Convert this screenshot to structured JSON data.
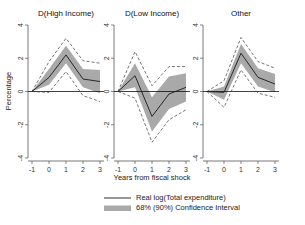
{
  "figure": {
    "xlabel": "Years from fiscal shock",
    "ylabel": "Percentage"
  },
  "legend": {
    "line_label": "Real log(Total expenditure)",
    "band_label": "68% (90%) Confidence Interval",
    "line_color": "#1a1a1a",
    "band_color": "#a9a9a9"
  },
  "chart_data": {
    "type": "line",
    "title": "",
    "xlabel": "Years from fiscal shock",
    "ylabel": "Percentage",
    "x": [
      -1,
      0,
      1,
      2,
      3
    ],
    "xticks": [
      "-1",
      "0",
      "1",
      "2",
      "3"
    ],
    "yticks": [
      "-4",
      "-2",
      "0",
      "2",
      "4"
    ],
    "ylim": [
      -4,
      4
    ],
    "xlim": [
      -1,
      3
    ],
    "grid": false,
    "legend_position": "bottom",
    "panels": [
      {
        "title": "D(High Income)",
        "series": [
          {
            "name": "Real log(Total expenditure)",
            "values": [
              0,
              0.85,
              2.2,
              0.75,
              0.6
            ]
          },
          {
            "name": "68% CI upper",
            "values": [
              0,
              1.35,
              2.75,
              1.35,
              1.3
            ]
          },
          {
            "name": "68% CI lower",
            "values": [
              0,
              0.4,
              1.7,
              0.25,
              -0.1
            ]
          },
          {
            "name": "90% CI upper",
            "values": [
              0,
              1.8,
              3.2,
              1.85,
              1.7
            ]
          },
          {
            "name": "90% CI lower",
            "values": [
              0,
              -0.05,
              1.2,
              -0.25,
              -0.6
            ]
          }
        ]
      },
      {
        "title": "D(Low Income)",
        "series": [
          {
            "name": "Real log(Total expenditure)",
            "values": [
              0,
              0.95,
              -1.5,
              -0.15,
              0.25
            ]
          },
          {
            "name": "68% CI upper",
            "values": [
              0,
              1.7,
              -0.35,
              0.9,
              1.1
            ]
          },
          {
            "name": "68% CI lower",
            "values": [
              0,
              0.25,
              -2.4,
              -1.05,
              -0.6
            ]
          },
          {
            "name": "90% CI upper",
            "values": [
              0,
              2.4,
              0.35,
              1.5,
              1.5
            ]
          },
          {
            "name": "90% CI lower",
            "values": [
              0,
              -0.4,
              -3.05,
              -1.7,
              -1.1
            ]
          }
        ]
      },
      {
        "title": "Other",
        "series": [
          {
            "name": "Real log(Total expenditure)",
            "values": [
              0,
              -0.05,
              2.3,
              0.85,
              0.45
            ]
          },
          {
            "name": "68% CI upper",
            "values": [
              0,
              0.3,
              2.85,
              1.4,
              1.05
            ]
          },
          {
            "name": "68% CI lower",
            "values": [
              0,
              -0.5,
              1.7,
              0.3,
              -0.05
            ]
          },
          {
            "name": "90% CI upper",
            "values": [
              0,
              0.65,
              3.25,
              1.8,
              1.4
            ]
          },
          {
            "name": "90% CI lower",
            "values": [
              0,
              -0.95,
              1.3,
              -0.1,
              -0.35
            ]
          }
        ]
      }
    ]
  }
}
